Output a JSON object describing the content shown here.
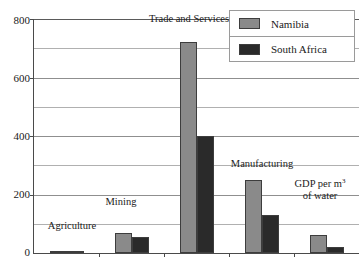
{
  "chart_data": {
    "type": "bar",
    "title": "",
    "xlabel": "",
    "ylabel": "",
    "ylim": [
      0,
      800
    ],
    "y_ticks": [
      0,
      200,
      400,
      600,
      800
    ],
    "y_gridlines": [
      100,
      200,
      300,
      400,
      500,
      600,
      700,
      800
    ],
    "grid": true,
    "legend_position": "top-right",
    "categories": [
      "Agriculture",
      "Mining",
      "Trade and Services",
      "Manufacturing",
      "GDP per m³ of water"
    ],
    "series": [
      {
        "name": "Namibia",
        "color": "#8a8a8a",
        "values": [
          8,
          70,
          720,
          250,
          60
        ]
      },
      {
        "name": "South Africa",
        "color": "#2a2a2a",
        "values": [
          3,
          55,
          400,
          130,
          22
        ]
      }
    ],
    "category_labels": [
      {
        "text": "Agriculture",
        "line2": ""
      },
      {
        "text": "Mining",
        "line2": ""
      },
      {
        "text": "Trade and Services",
        "line2": ""
      },
      {
        "text": "Manufacturing",
        "line2": ""
      },
      {
        "text": "GDP per m",
        "sup": "3",
        "line2": "of water"
      }
    ]
  },
  "axis": {
    "tick_800": "800",
    "tick_600": "600",
    "tick_400": "400",
    "tick_200": "200",
    "tick_0": "0"
  },
  "legend": {
    "items": [
      {
        "label": "Namibia"
      },
      {
        "label": "South Africa"
      }
    ]
  },
  "labels": {
    "agriculture": "Agriculture",
    "mining": "Mining",
    "trade_and_services": "Trade and Services",
    "manufacturing": "Manufacturing",
    "gdp_line1": "GDP per m",
    "gdp_sup": "3",
    "gdp_line2": "of water"
  }
}
